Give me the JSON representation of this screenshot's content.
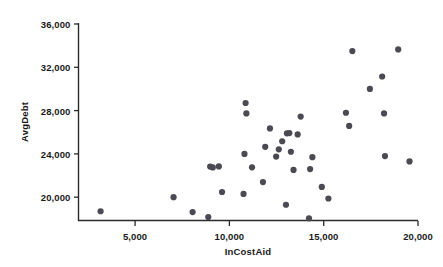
{
  "chart_data": {
    "type": "scatter",
    "title": "",
    "xlabel": "InCostAid",
    "ylabel": "AvgDebt",
    "xlim": [
      2000,
      20000
    ],
    "ylim": [
      17800,
      36000
    ],
    "grid": false,
    "legend": null,
    "xticks": [
      5000,
      10000,
      15000,
      20000
    ],
    "yticks": [
      20000,
      24000,
      28000,
      32000,
      36000
    ],
    "xtick_labels": [
      "5,000",
      "10,000",
      "15,000",
      "20,000"
    ],
    "ytick_labels": [
      "20,000",
      "24,000",
      "28,000",
      "32,000",
      "36,000"
    ],
    "marker": {
      "shape": "circle",
      "color": "#4a4a52",
      "size": 3.1
    },
    "axis_color": "#2b2b2b",
    "background": "#ffffff",
    "points": [
      {
        "x": 3170,
        "y": 18700
      },
      {
        "x": 7040,
        "y": 20000
      },
      {
        "x": 8050,
        "y": 18620
      },
      {
        "x": 8880,
        "y": 18160
      },
      {
        "x": 8980,
        "y": 22830
      },
      {
        "x": 9120,
        "y": 22750
      },
      {
        "x": 9440,
        "y": 22840
      },
      {
        "x": 9610,
        "y": 20480
      },
      {
        "x": 10750,
        "y": 20300
      },
      {
        "x": 10800,
        "y": 24000
      },
      {
        "x": 10860,
        "y": 28700
      },
      {
        "x": 10900,
        "y": 27740
      },
      {
        "x": 11200,
        "y": 22760
      },
      {
        "x": 11780,
        "y": 21400
      },
      {
        "x": 11900,
        "y": 24650
      },
      {
        "x": 12150,
        "y": 26350
      },
      {
        "x": 12480,
        "y": 23750
      },
      {
        "x": 12620,
        "y": 24420
      },
      {
        "x": 12800,
        "y": 25170
      },
      {
        "x": 13000,
        "y": 19300
      },
      {
        "x": 13050,
        "y": 25900
      },
      {
        "x": 13180,
        "y": 25920
      },
      {
        "x": 13260,
        "y": 24200
      },
      {
        "x": 13400,
        "y": 22520
      },
      {
        "x": 13620,
        "y": 25800
      },
      {
        "x": 13780,
        "y": 27450
      },
      {
        "x": 14220,
        "y": 18050
      },
      {
        "x": 14280,
        "y": 22600
      },
      {
        "x": 14400,
        "y": 23700
      },
      {
        "x": 14900,
        "y": 20950
      },
      {
        "x": 15250,
        "y": 19880
      },
      {
        "x": 16180,
        "y": 27800
      },
      {
        "x": 16350,
        "y": 26580
      },
      {
        "x": 16520,
        "y": 33500
      },
      {
        "x": 17450,
        "y": 30000
      },
      {
        "x": 18100,
        "y": 31150
      },
      {
        "x": 18200,
        "y": 27740
      },
      {
        "x": 18250,
        "y": 23800
      },
      {
        "x": 18950,
        "y": 33650
      },
      {
        "x": 19550,
        "y": 23300
      }
    ]
  }
}
